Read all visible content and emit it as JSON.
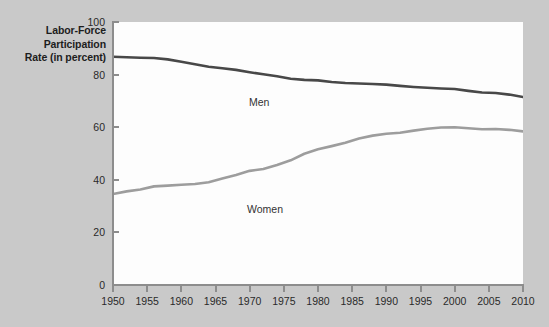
{
  "figure": {
    "background_color": "#c9c9c9",
    "plot_background_color": "#fdfdfd",
    "axis_color": "#8d8d8d"
  },
  "axis_title": {
    "line1": "Labor-Force",
    "line2": "Participation",
    "line3": "Rate (in percent)"
  },
  "chart_data": {
    "type": "line",
    "title": "",
    "subtitle": "",
    "xlabel": "",
    "ylabel": "Labor-Force Participation Rate (in percent)",
    "xlim": [
      1950,
      2010
    ],
    "ylim": [
      0,
      100
    ],
    "grid": false,
    "legend_position": "inline-annotation",
    "xticks": [
      1950,
      1955,
      1960,
      1965,
      1970,
      1975,
      1980,
      1985,
      1990,
      1995,
      2000,
      2005,
      2010
    ],
    "xtick_labels": [
      "1950",
      "1955",
      "1960",
      "1965",
      "1970",
      "1975",
      "1980",
      "1985",
      "1990",
      "1995",
      "2000",
      "2005",
      "2010"
    ],
    "yticks": [
      0,
      20,
      40,
      60,
      80,
      100
    ],
    "ytick_labels": [
      "0",
      "20",
      "40",
      "60",
      "80",
      "100"
    ],
    "x": [
      1950,
      1952,
      1954,
      1956,
      1958,
      1960,
      1962,
      1964,
      1966,
      1968,
      1970,
      1972,
      1974,
      1976,
      1978,
      1980,
      1982,
      1984,
      1986,
      1988,
      1990,
      1992,
      1994,
      1996,
      1998,
      2000,
      2002,
      2004,
      2006,
      2008,
      2010
    ],
    "series": [
      {
        "name": "Men",
        "color": "#484848",
        "line_width": 2.6,
        "values": [
          86.8,
          86.6,
          86.4,
          86.3,
          85.8,
          84.9,
          83.9,
          83.0,
          82.4,
          81.8,
          80.9,
          80.1,
          79.4,
          78.4,
          78.0,
          77.8,
          77.2,
          76.8,
          76.6,
          76.4,
          76.2,
          75.7,
          75.3,
          75.0,
          74.7,
          74.5,
          73.8,
          73.2,
          73.0,
          72.4,
          71.5
        ]
      },
      {
        "name": "Women",
        "color": "#9d9d9d",
        "line_width": 2.6,
        "values": [
          34.6,
          35.6,
          36.3,
          37.5,
          37.8,
          38.1,
          38.4,
          39.1,
          40.5,
          41.8,
          43.4,
          44.1,
          45.6,
          47.4,
          49.9,
          51.6,
          52.8,
          54.1,
          55.7,
          56.8,
          57.5,
          57.9,
          58.7,
          59.4,
          59.9,
          60.0,
          59.6,
          59.2,
          59.3,
          59.0,
          58.4
        ]
      }
    ],
    "annotations": [
      {
        "text": "Men",
        "x": 1975,
        "y": 84
      },
      {
        "text": "Women",
        "x": 1977,
        "y": 37
      }
    ]
  }
}
